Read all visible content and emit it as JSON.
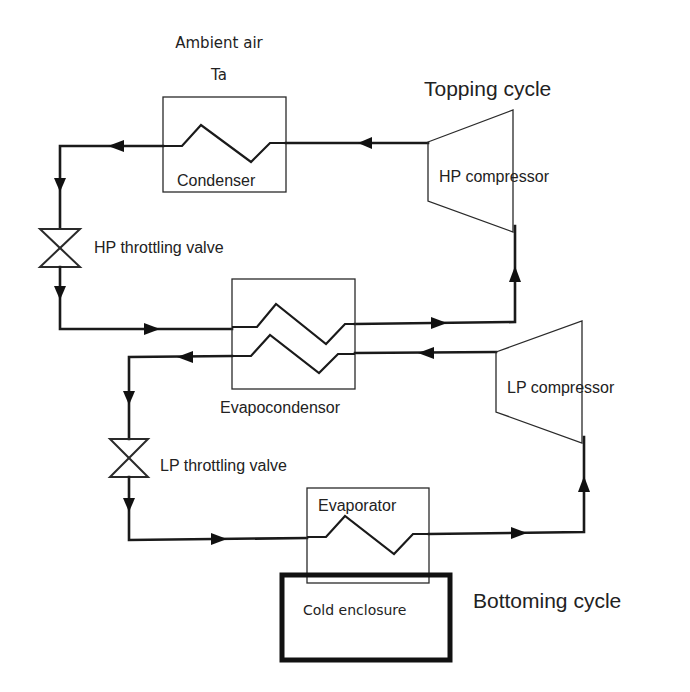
{
  "diagram": {
    "type": "cascade refrigeration cycle schematic",
    "labels": {
      "ambient_air": "Ambient air",
      "ambient_temp": "Ta",
      "topping_cycle": "Topping cycle",
      "bottoming_cycle": "Bottoming cycle",
      "condenser": "Condenser",
      "hp_compressor": "HP compressor",
      "hp_valve": "HP throttling valve",
      "evapocondensor": "Evapocondensor",
      "lp_compressor": "LP compressor",
      "lp_valve": "LP throttling valve",
      "evaporator": "Evaporator",
      "cold_enclosure": "Cold enclosure"
    },
    "components": [
      {
        "id": "condenser",
        "kind": "heat-exchanger",
        "cycle": "topping"
      },
      {
        "id": "hp_compressor",
        "kind": "compressor",
        "cycle": "topping"
      },
      {
        "id": "hp_valve",
        "kind": "throttling-valve",
        "cycle": "topping"
      },
      {
        "id": "evapocondensor",
        "kind": "heat-exchanger",
        "cycle": "shared"
      },
      {
        "id": "lp_compressor",
        "kind": "compressor",
        "cycle": "bottoming"
      },
      {
        "id": "lp_valve",
        "kind": "throttling-valve",
        "cycle": "bottoming"
      },
      {
        "id": "evaporator",
        "kind": "heat-exchanger",
        "cycle": "bottoming"
      },
      {
        "id": "cold_enclosure",
        "kind": "enclosure",
        "cycle": "bottoming"
      }
    ],
    "colors": {
      "line": "#1a1a1a",
      "text": "#222222",
      "background": "#ffffff"
    }
  }
}
